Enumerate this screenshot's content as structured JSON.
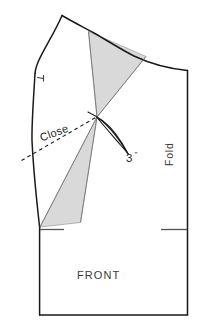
{
  "diagram": {
    "type": "sewing-pattern-draft",
    "title_label": "FRONT",
    "fold_label": "Fold",
    "close_label": "Close",
    "dart_measure_value": "3",
    "dart_measure_unit": "\"",
    "colors": {
      "outline": "#1a1a1a",
      "shaded_wedge_fill": "#d9d9d9",
      "shaded_wedge_stroke": "#8c8c8c",
      "dashed_line": "#1a1a1a",
      "text": "#2b2b2b",
      "background": "#ffffff"
    },
    "geometry": {
      "outline_path": "M 62,15 L 35,72 L 32,139 L 40,222 L 40,315 L 188,315 L 188,70 L 62,15 Z",
      "bodice_outline": "M 62,15 C 52,35 38,52 35,73 C 33,105 31,122 32,140 C 35,170 38,200 40,222 L 188,315 L 188,70",
      "shoulder_curve": "M 62,15 C 82,25 104,33 126,44 C 150,56 170,64 188,70",
      "armhole_curve": "M 62,15 C 52,35 38,52 35,73",
      "side_seam": "M 35,73 C 33,105 31,122 32,140 L 40,222",
      "waist_line_left": "M 40,230 L 63,230",
      "waist_line_right": "M 160,230 L 188,230",
      "fold_line": "M 188,70 L 188,315",
      "hem_line": "M 40,315 L 188,315",
      "left_edge_lower": "M 40,230 L 40,315",
      "dart_apex": [
        97,
        117
      ],
      "shoulder_wedge": "M 88,31 L 97,117 L 146,56 Z",
      "hip_wedge": "M 97,117 L 40,227 L 80,223 Z",
      "dart_pointer_curve": "M 97,117 C 110,128 122,140 134,152 C 120,136 110,124 97,117 Z",
      "close_dashed_line": "M 22,160 L 97,117",
      "notch_mark": "M 36,78 L 42,79",
      "waist_tick_left": "M 40,230 L 64,230",
      "waist_tick_right": "M 160,229 L 187,229"
    }
  }
}
